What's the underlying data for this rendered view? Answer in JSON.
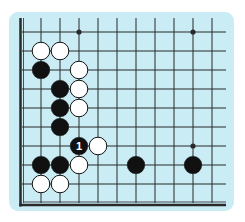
{
  "diagram": {
    "type": "go-board-fragment",
    "colors": {
      "page_bg": "#ffffff",
      "board_bg": "#c9ecf5",
      "line": "#2a2a2a",
      "black_stone": "#111111",
      "white_stone": "#ffffff",
      "white_stroke": "#111111",
      "label_on_black": "#ffffff"
    },
    "grid": {
      "x_origin": 22,
      "y_origin": 32,
      "spacing": 19,
      "cols": 11,
      "rows": 10,
      "right_extent": 226,
      "left_edge": true,
      "bottom_edge": true
    },
    "star_points": [
      {
        "col": 3,
        "row": 0
      },
      {
        "col": 9,
        "row": 0
      },
      {
        "col": 9,
        "row": 6
      }
    ],
    "stones": [
      {
        "color": "white",
        "col": 1,
        "row": 1
      },
      {
        "color": "white",
        "col": 2,
        "row": 1
      },
      {
        "color": "black",
        "col": 1,
        "row": 2
      },
      {
        "color": "white",
        "col": 3,
        "row": 2
      },
      {
        "color": "black",
        "col": 2,
        "row": 3
      },
      {
        "color": "white",
        "col": 3,
        "row": 3
      },
      {
        "color": "black",
        "col": 2,
        "row": 4
      },
      {
        "color": "white",
        "col": 3,
        "row": 4
      },
      {
        "color": "black",
        "col": 2,
        "row": 5
      },
      {
        "color": "black",
        "col": 3,
        "row": 6,
        "label": "1"
      },
      {
        "color": "white",
        "col": 4,
        "row": 6
      },
      {
        "color": "black",
        "col": 1,
        "row": 7
      },
      {
        "color": "black",
        "col": 2,
        "row": 7
      },
      {
        "color": "white",
        "col": 3,
        "row": 7
      },
      {
        "color": "black",
        "col": 6,
        "row": 7
      },
      {
        "color": "black",
        "col": 9,
        "row": 7
      },
      {
        "color": "white",
        "col": 1,
        "row": 8
      },
      {
        "color": "white",
        "col": 2,
        "row": 8
      }
    ],
    "move_labels": [
      "1"
    ]
  }
}
